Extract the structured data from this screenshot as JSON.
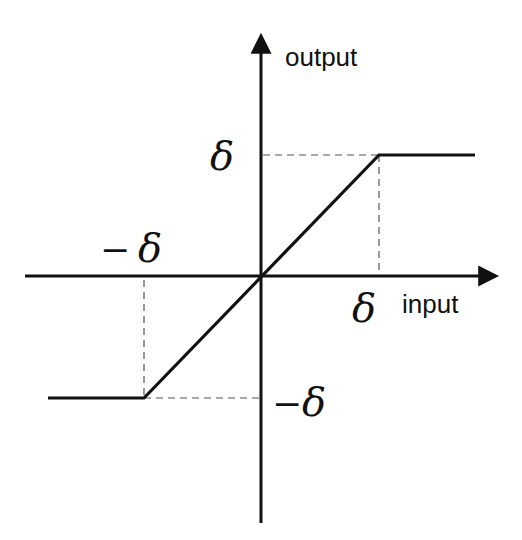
{
  "diagram": {
    "type": "saturation function",
    "axes": {
      "x_label": "input",
      "y_label": "output"
    },
    "annotations": {
      "pos_x_tick": "δ",
      "neg_x_tick_minus": "−",
      "neg_x_tick": "δ",
      "pos_y_tick": "δ",
      "neg_y_tick_minus": "−",
      "neg_y_tick": "δ"
    },
    "curve": {
      "points": [
        [
          -2,
          -1
        ],
        [
          -1,
          -1
        ],
        [
          0,
          0
        ],
        [
          1,
          1
        ],
        [
          2,
          1
        ]
      ],
      "description": "linear between -δ and δ, saturating at ±δ"
    },
    "colors": {
      "line": "#111111",
      "dashed": "#555555",
      "background": "#ffffff"
    }
  }
}
